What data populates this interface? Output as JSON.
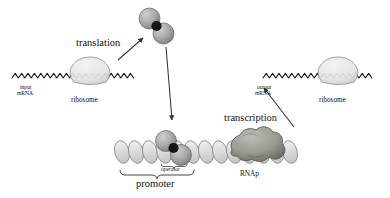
{
  "figure": {
    "type": "biological-pathway-diagram",
    "background_color": "#ffffff",
    "ink_color": "#111111"
  },
  "labels": {
    "translation": "translation",
    "transcription": "transcription",
    "input_mrna_line1": "input",
    "input_mrna_line2": "mRNA",
    "output_mrna_line1": "output",
    "output_mrna_line2": "mRNA",
    "ribosome_left": "ribosome",
    "ribosome_right": "ribosome",
    "operator": "operator",
    "promoter": "promoter",
    "rnap": "RNAp"
  },
  "elements": {
    "input_mrna_strand": "input-mrna-zigzag-strand",
    "output_mrna_strand": "output-mrna-zigzag-strand",
    "left_ribosome_shape": "ribosome-ellipse",
    "right_ribosome_shape": "ribosome-ellipse",
    "protein_dimer_free": "protein-dimer-two-spheres",
    "protein_dimer_bound": "protein-dimer-bound-to-operator",
    "dna_helix": "dna-double-helix",
    "rnap_blob": "rna-polymerase-blob",
    "promoter_brace": "curly-brace",
    "arrow_translation": "arrow-mrna-to-protein",
    "arrow_binding": "arrow-protein-to-operator",
    "arrow_transcription": "arrow-rnap-to-output-mrna"
  },
  "colors": {
    "sphere_fill": "#a9a9a9",
    "sphere_edge": "#6f6f6f",
    "dimer_link": "#1a1a1a",
    "ribosome_fill": "#e4e4e4",
    "ribosome_edge": "#8a8a8a",
    "dna_fill": "#d8d8d8",
    "dna_edge": "#8a8a8a",
    "rnap_fill": "#9c9c94",
    "rnap_edge": "#5e5e58",
    "strand": "#1a1a1a",
    "arrow": "#333333"
  }
}
